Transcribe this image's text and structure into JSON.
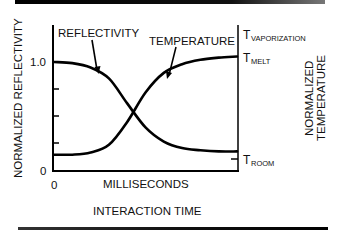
{
  "chart_data": {
    "type": "line",
    "title": "",
    "xlabel": "INTERACTION TIME",
    "x_unit_label": "MILLISECONDS",
    "ylabel_left": "NORMALIZED REFLECTIVITY",
    "ylabel_right": "NORMALIZED TEMPERATURE",
    "x_tick_labels": [
      "0"
    ],
    "y_left_tick_labels": [
      "0",
      "1.0"
    ],
    "y_right_tick_labels": [
      {
        "base": "T",
        "sub": "ROOM",
        "level": "room"
      },
      {
        "base": "T",
        "sub": "MELT",
        "level": "melt"
      },
      {
        "base": "T",
        "sub": "VAPORIZATION",
        "level": "vaporization"
      }
    ],
    "xlim": [
      0,
      1
    ],
    "ylim_left": [
      0,
      1.3
    ],
    "grid": false,
    "legend": "annotations with arrows",
    "annotations": [
      {
        "text": "REFLECTIVITY",
        "target_series": "Reflectivity"
      },
      {
        "text": "TEMPERATURE",
        "target_series": "Temperature"
      }
    ],
    "x": [
      0.0,
      0.1,
      0.2,
      0.3,
      0.4,
      0.5,
      0.6,
      0.7,
      0.8,
      0.9,
      1.0
    ],
    "series": [
      {
        "name": "Reflectivity",
        "axis": "left",
        "values": [
          1.0,
          0.99,
          0.95,
          0.85,
          0.62,
          0.4,
          0.27,
          0.21,
          0.19,
          0.18,
          0.18
        ]
      },
      {
        "name": "Temperature",
        "axis": "right",
        "values": [
          0.15,
          0.15,
          0.17,
          0.24,
          0.45,
          0.72,
          0.9,
          0.98,
          1.02,
          1.04,
          1.05
        ]
      }
    ]
  },
  "labels": {
    "reflectivity": "REFLECTIVITY",
    "temperature": "TEMPERATURE",
    "y_left_title": "NORMALIZED REFLECTIVITY",
    "y_right_title_line1": "NORMALIZED",
    "y_right_title_line2": "TEMPERATURE",
    "x_units": "MILLISECONDS",
    "x_title": "INTERACTION TIME",
    "y_tick_one": "1.0",
    "y_tick_zero": "0",
    "x_tick_zero": "0",
    "t_base": "T",
    "t_vapor_sub": "VAPORIZATION",
    "t_melt_sub": "MELT",
    "t_room_sub": "ROOM"
  }
}
